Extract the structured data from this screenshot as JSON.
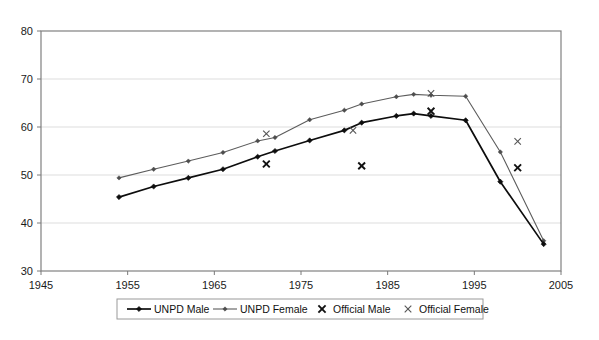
{
  "chart_data": {
    "type": "line",
    "title": "",
    "subtitle": "",
    "xlabel": "",
    "ylabel": "",
    "xlim": [
      1945,
      2005
    ],
    "ylim": [
      30,
      80
    ],
    "xticks": [
      1945,
      1955,
      1965,
      1975,
      1985,
      1995,
      2005
    ],
    "yticks": [
      30,
      40,
      50,
      60,
      70,
      80
    ],
    "xtick_labels": [
      "1945",
      "1955",
      "1965",
      "1975",
      "1985",
      "1995",
      "2005"
    ],
    "ytick_labels": [
      "30",
      "40",
      "50",
      "60",
      "70",
      "80"
    ],
    "grid": "horizontal",
    "legend_position": "bottom",
    "series": [
      {
        "name": "UNPD Male",
        "style": "line-marker",
        "color": "#0d0d0d",
        "marker": "diamond",
        "x": [
          1954,
          1958,
          1962,
          1966,
          1970,
          1972,
          1976,
          1980,
          1982,
          1986,
          1988,
          1990,
          1994,
          1998,
          2003
        ],
        "values": [
          45.4,
          47.6,
          49.4,
          51.2,
          53.8,
          55.0,
          57.2,
          59.3,
          60.9,
          62.3,
          62.8,
          62.3,
          61.4,
          48.6,
          35.6
        ]
      },
      {
        "name": "UNPD Female",
        "style": "line-marker",
        "color": "#5c5c5c",
        "marker": "diamond",
        "x": [
          1954,
          1958,
          1962,
          1966,
          1970,
          1972,
          1976,
          1980,
          1982,
          1986,
          1988,
          1990,
          1994,
          1998,
          2003
        ],
        "values": [
          49.4,
          51.2,
          52.9,
          54.7,
          57.1,
          57.8,
          61.5,
          63.5,
          64.8,
          66.3,
          66.8,
          66.6,
          66.4,
          54.8,
          36.3
        ]
      },
      {
        "name": "Official Male",
        "style": "scatter",
        "color": "#111111",
        "marker": "x-bold",
        "x": [
          1971,
          1982,
          1990,
          2000
        ],
        "values": [
          52.3,
          51.9,
          63.3,
          51.5
        ]
      },
      {
        "name": "Official Female",
        "style": "scatter",
        "color": "#555555",
        "marker": "x-thin",
        "x": [
          1971,
          1981,
          1990,
          2000
        ],
        "values": [
          58.6,
          59.3,
          67.0,
          57.0
        ]
      }
    ]
  },
  "legend": {
    "items": [
      {
        "label": "UNPD Male",
        "marker": "line-diamond-dark"
      },
      {
        "label": "UNPD Female",
        "marker": "line-diamond-gray"
      },
      {
        "label": "Official Male",
        "marker": "x-bold"
      },
      {
        "label": "Official Female",
        "marker": "x-thin"
      }
    ]
  }
}
